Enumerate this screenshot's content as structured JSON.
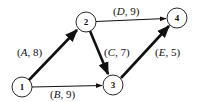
{
  "diagram": {
    "type": "activity-network",
    "nodes": [
      {
        "id": "1",
        "label": "1",
        "cx": 22,
        "cy": 87
      },
      {
        "id": "2",
        "label": "2",
        "cx": 86,
        "cy": 22
      },
      {
        "id": "3",
        "label": "3",
        "cx": 113,
        "cy": 85
      },
      {
        "id": "4",
        "label": "4",
        "cx": 177,
        "cy": 18
      }
    ],
    "edges": [
      {
        "from": "1",
        "to": "2",
        "activity": "A",
        "duration": "8",
        "label": "(A, 8)",
        "critical": true
      },
      {
        "from": "1",
        "to": "3",
        "activity": "B",
        "duration": "9",
        "label": "(B, 9)",
        "critical": false
      },
      {
        "from": "2",
        "to": "3",
        "activity": "C",
        "duration": "7",
        "label": "(C, 7)",
        "critical": true
      },
      {
        "from": "2",
        "to": "4",
        "activity": "D",
        "duration": "9",
        "label": "(D, 9)",
        "critical": false
      },
      {
        "from": "3",
        "to": "4",
        "activity": "E",
        "duration": "5",
        "label": "(E, 5)",
        "critical": true
      }
    ],
    "colors": {
      "stroke": "#111111",
      "background": "#ffffff"
    }
  }
}
